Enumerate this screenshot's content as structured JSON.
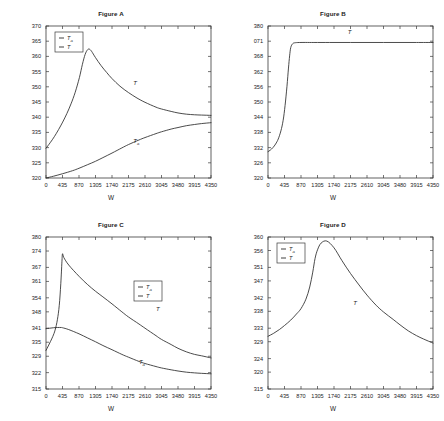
{
  "page": {
    "background": "#ffffff",
    "line_color": "#2b2b2b",
    "axis_color": "#3a3a3a"
  },
  "xaxis_label": "W",
  "xticks": [
    "0",
    "435",
    "870",
    "1305",
    "1740",
    "2175",
    "2610",
    "3045",
    "3480",
    "3915",
    "4350"
  ],
  "legend_labels": {
    "ta": "T",
    "ta_sub": "a",
    "t": "T"
  },
  "chart_data": [
    {
      "id": "figure-a",
      "type": "line",
      "title": "Figure A",
      "xlabel": "W",
      "ylabel": "",
      "xlim": [
        0,
        4350
      ],
      "ylim": [
        320,
        370
      ],
      "xticks": [
        0,
        435,
        870,
        1305,
        1740,
        2175,
        2610,
        3045,
        3480,
        3915,
        4350
      ],
      "yticks": [
        320,
        325,
        330,
        335,
        340,
        345,
        350,
        355,
        360,
        365,
        370
      ],
      "ytick_labels": [
        "320",
        "325",
        "330",
        "335",
        "340",
        "345",
        "350",
        "355",
        "360",
        "365",
        "370"
      ],
      "grid": false,
      "legend_position": "top-left",
      "legend_entries": [
        "T_a",
        "T"
      ],
      "annotations": [
        {
          "text": "T",
          "x": 2300,
          "y": 350.5
        },
        {
          "text": "T_a",
          "x": 2300,
          "y": 331.5
        }
      ],
      "series": [
        {
          "name": "T",
          "label": "T",
          "x": [
            0,
            110,
            220,
            330,
            440,
            550,
            660,
            770,
            880,
            960,
            1030,
            1090,
            1140,
            1200,
            1305,
            1450,
            1600,
            1740,
            1950,
            2175,
            2400,
            2610,
            2900,
            3045,
            3300,
            3480,
            3700,
            3915,
            4100,
            4350
          ],
          "values": [
            329.8,
            331.6,
            333.6,
            335.9,
            338.4,
            341.2,
            344.4,
            348.2,
            353.0,
            357.4,
            360.6,
            362.1,
            362.4,
            361.7,
            359.6,
            357.0,
            354.7,
            352.7,
            350.2,
            348.1,
            346.3,
            344.9,
            343.3,
            342.7,
            341.9,
            341.4,
            341.0,
            340.8,
            340.7,
            340.6
          ]
        },
        {
          "name": "T_a",
          "label": "T_a",
          "x": [
            0,
            200,
            435,
            700,
            870,
            1100,
            1305,
            1500,
            1740,
            2000,
            2175,
            2450,
            2610,
            2900,
            3045,
            3300,
            3480,
            3700,
            3915,
            4100,
            4350
          ],
          "values": [
            320.0,
            320.6,
            321.4,
            322.4,
            323.2,
            324.4,
            325.5,
            326.7,
            328.2,
            329.9,
            331.0,
            332.5,
            333.3,
            334.6,
            335.2,
            336.1,
            336.6,
            337.2,
            337.6,
            337.9,
            338.2
          ]
        }
      ]
    },
    {
      "id": "figure-b",
      "type": "line",
      "title": "Figure B",
      "xlabel": "W",
      "ylabel": "",
      "xlim": [
        0,
        4350
      ],
      "ylim": [
        320,
        380
      ],
      "xticks": [
        0,
        435,
        870,
        1305,
        1740,
        2175,
        2610,
        3045,
        3480,
        3915,
        4350
      ],
      "yticks": [
        320,
        326,
        332,
        338,
        344,
        350,
        356,
        362,
        368,
        374,
        380
      ],
      "ytick_labels": [
        "320",
        "326",
        "332",
        "338",
        "344",
        "350",
        "356",
        "362",
        "368",
        "071",
        "380"
      ],
      "grid": false,
      "legend_position": "none",
      "legend_entries": [],
      "annotations": [
        {
          "text": "T",
          "x": 2100,
          "y": 377.0
        }
      ],
      "series": [
        {
          "name": "T",
          "label": "T",
          "x": [
            0,
            60,
            130,
            200,
            270,
            340,
            400,
            450,
            500,
            540,
            570,
            600,
            650,
            720,
            870,
            1100,
            1305,
            1740,
            2175,
            2610,
            3045,
            3480,
            3915,
            4350
          ],
          "values": [
            330.4,
            331.0,
            332.0,
            333.4,
            335.4,
            338.6,
            342.8,
            348.6,
            356.2,
            363.4,
            368.2,
            371.5,
            373.0,
            373.4,
            373.5,
            373.5,
            373.5,
            373.5,
            373.5,
            373.5,
            373.5,
            373.5,
            373.5,
            373.5
          ]
        }
      ]
    },
    {
      "id": "figure-c",
      "type": "line",
      "title": "Figure C",
      "xlabel": "W",
      "ylabel": "",
      "xlim": [
        0,
        4350
      ],
      "ylim": [
        315,
        380
      ],
      "xticks": [
        0,
        435,
        870,
        1305,
        1740,
        2175,
        2610,
        3045,
        3480,
        3915,
        4350
      ],
      "yticks": [
        315,
        322,
        329,
        335,
        341,
        348,
        354,
        361,
        367,
        374,
        380
      ],
      "ytick_labels": [
        "315",
        "322",
        "329",
        "335",
        "341",
        "348",
        "354",
        "361",
        "367",
        "374",
        "380"
      ],
      "grid": false,
      "legend_position": "center-right",
      "legend_entries": [
        "T_a",
        "T"
      ],
      "annotations": [
        {
          "text": "T",
          "x": 2900,
          "y": 348.5
        },
        {
          "text": "T_a",
          "x": 2450,
          "y": 325.5
        }
      ],
      "series": [
        {
          "name": "T",
          "label": "T",
          "x": [
            0,
            60,
            120,
            180,
            240,
            300,
            350,
            390,
            420,
            435,
            470,
            600,
            870,
            1100,
            1305,
            1500,
            1740,
            2000,
            2175,
            2450,
            2610,
            2900,
            3045,
            3300,
            3480,
            3700,
            3915,
            4100,
            4350
          ],
          "values": [
            331.5,
            333.4,
            335.4,
            337.5,
            340.2,
            344.6,
            350.8,
            360.0,
            369.4,
            372.8,
            371.2,
            368.0,
            363.2,
            359.6,
            356.8,
            354.4,
            351.4,
            348.0,
            345.8,
            342.8,
            341.0,
            337.8,
            336.2,
            334.0,
            332.4,
            330.9,
            329.8,
            329.2,
            328.3
          ]
        },
        {
          "name": "T_a",
          "label": "T_a",
          "x": [
            0,
            100,
            200,
            300,
            400,
            435,
            600,
            870,
            1100,
            1305,
            1500,
            1740,
            2000,
            2175,
            2450,
            2610,
            2900,
            3045,
            3300,
            3480,
            3700,
            3915,
            4100,
            4350
          ],
          "values": [
            340.8,
            341.0,
            341.2,
            341.3,
            341.3,
            341.2,
            340.4,
            338.6,
            336.8,
            335.2,
            333.6,
            331.8,
            329.8,
            328.6,
            326.8,
            325.9,
            324.6,
            324.0,
            323.2,
            322.7,
            322.2,
            321.9,
            321.7,
            321.5
          ]
        }
      ]
    },
    {
      "id": "figure-d",
      "type": "line",
      "title": "Figure D",
      "xlabel": "W",
      "ylabel": "",
      "xlim": [
        0,
        4350
      ],
      "ylim": [
        315,
        360
      ],
      "xticks": [
        0,
        435,
        870,
        1305,
        1740,
        2175,
        2610,
        3045,
        3480,
        3915,
        4350
      ],
      "yticks": [
        315,
        320,
        324,
        329,
        333,
        338,
        342,
        347,
        351,
        356,
        360
      ],
      "ytick_labels": [
        "315",
        "320",
        "324",
        "329",
        "333",
        "338",
        "342",
        "347",
        "351",
        "356",
        "360"
      ],
      "grid": false,
      "legend_position": "top-left",
      "legend_entries": [
        "T_a",
        "T"
      ],
      "annotations": [
        {
          "text": "T",
          "x": 2250,
          "y": 340.0
        }
      ],
      "series": [
        {
          "name": "T",
          "label": "T",
          "x": [
            0,
            150,
            300,
            435,
            600,
            750,
            870,
            1000,
            1100,
            1180,
            1240,
            1305,
            1400,
            1550,
            1740,
            1950,
            2175,
            2400,
            2610,
            2850,
            3045,
            3300,
            3480,
            3700,
            3915,
            4100,
            4350
          ],
          "values": [
            330.6,
            331.5,
            332.6,
            333.8,
            335.4,
            337.2,
            338.8,
            341.6,
            345.2,
            349.6,
            353.6,
            356.2,
            358.2,
            358.8,
            356.8,
            353.0,
            349.2,
            345.8,
            342.8,
            339.8,
            337.8,
            335.6,
            334.0,
            332.2,
            330.8,
            329.8,
            328.6
          ]
        }
      ]
    }
  ]
}
